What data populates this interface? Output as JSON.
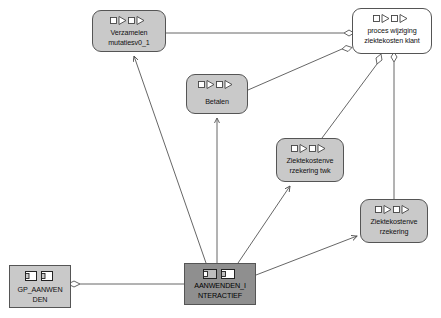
{
  "diagram": {
    "background_color": "#ffffff",
    "node_fill_grey": "#c9c9c9",
    "node_fill_white": "#ffffff",
    "node_fill_dark": "#8f8f8f",
    "node_border_color": "#555555",
    "edge_color": "#555555"
  },
  "nodes": [
    {
      "id": "verzamelen",
      "label_lines": [
        "Verzamelen",
        "mutatiesv0_1"
      ],
      "icon": "process-sequence-icon",
      "shape": "rounded-rectangle",
      "fill": "#c9c9c9",
      "x": 92,
      "y": 10,
      "w": 74,
      "h": 42
    },
    {
      "id": "proces-wijziging",
      "label_lines": [
        "proces wijziging",
        "ziektekosten klant"
      ],
      "icon": "process-sequence-icon",
      "shape": "rounded-rectangle",
      "fill": "#ffffff",
      "x": 352,
      "y": 8,
      "w": 80,
      "h": 46
    },
    {
      "id": "betalen",
      "label_lines": [
        "Betalen"
      ],
      "icon": "process-sequence-icon",
      "shape": "rounded-rectangle",
      "fill": "#c9c9c9",
      "x": 186,
      "y": 74,
      "w": 62,
      "h": 40
    },
    {
      "id": "ziektekosten-twk",
      "label_lines": [
        "Ziektekostenve",
        "rzekering twk"
      ],
      "icon": "process-sequence-icon",
      "shape": "rounded-rectangle",
      "fill": "#c9c9c9",
      "x": 276,
      "y": 138,
      "w": 68,
      "h": 44
    },
    {
      "id": "ziektekosten",
      "label_lines": [
        "Ziektekostenve",
        "rzekering"
      ],
      "icon": "process-sequence-icon",
      "shape": "rounded-rectangle",
      "fill": "#c9c9c9",
      "x": 360,
      "y": 199,
      "w": 68,
      "h": 44
    },
    {
      "id": "aanwenden-interactief",
      "label_lines": [
        "AANWENDEN_I",
        "NTERACTIEF"
      ],
      "icon": "component-pair-icon",
      "shape": "rectangle",
      "fill": "#8f8f8f",
      "x": 184,
      "y": 263,
      "w": 72,
      "h": 42
    },
    {
      "id": "gp-aanwenden",
      "label_lines": [
        "GP_AANWEN",
        "DEN"
      ],
      "icon": "component-pair-icon",
      "shape": "rectangle",
      "fill": "#c9c9c9",
      "x": 9,
      "y": 265,
      "w": 62,
      "h": 43
    }
  ],
  "edges": [
    {
      "id": "e1",
      "from": "verzamelen",
      "to": "proces-wijziging",
      "end_marker": "diamond"
    },
    {
      "id": "e2",
      "from": "betalen",
      "to": "proces-wijziging",
      "end_marker": "diamond"
    },
    {
      "id": "e3",
      "from": "ziektekosten-twk",
      "to": "proces-wijziging",
      "end_marker": "diamond"
    },
    {
      "id": "e4",
      "from": "ziektekosten",
      "to": "proces-wijziging",
      "end_marker": "diamond"
    },
    {
      "id": "e5",
      "from": "aanwenden-interactief",
      "to": "verzamelen",
      "end_marker": "arrow"
    },
    {
      "id": "e6",
      "from": "aanwenden-interactief",
      "to": "betalen",
      "end_marker": "arrow"
    },
    {
      "id": "e7",
      "from": "aanwenden-interactief",
      "to": "ziektekosten-twk",
      "end_marker": "arrow"
    },
    {
      "id": "e8",
      "from": "aanwenden-interactief",
      "to": "ziektekosten",
      "end_marker": "arrow"
    },
    {
      "id": "e9",
      "from": "aanwenden-interactief",
      "to": "gp-aanwenden",
      "end_marker": "diamond"
    }
  ]
}
